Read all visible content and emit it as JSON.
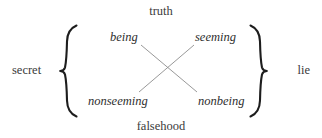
{
  "diagram": {
    "type": "semiotic-square",
    "title": "",
    "background_color": "#ffffff",
    "text_color": "#2e2e2e",
    "line_color": "#8d8d8d",
    "brace_color": "#1d1d1d",
    "axes": {
      "top_label": "truth",
      "bottom_label": "falsehood",
      "left_label": "secret",
      "right_label": "lie"
    },
    "terms": {
      "top_left": "being",
      "top_right": "seeming",
      "bottom_left": "nonseeming",
      "bottom_right": "nonbeing"
    },
    "relations": [
      {
        "name": "contradiction-being-nonbeing",
        "from": "being",
        "to": "nonbeing"
      },
      {
        "name": "contradiction-seeming-nonseeming",
        "from": "seeming",
        "to": "nonseeming"
      }
    ],
    "brackets": {
      "left": "{",
      "right": "}"
    }
  }
}
